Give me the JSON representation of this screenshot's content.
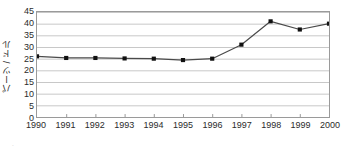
{
  "chart_data": {
    "type": "line",
    "title": "",
    "subtitle": "",
    "xlabel": "",
    "ylabel": "パーツ / ドル",
    "categories": [
      "1990",
      "1991",
      "1992",
      "1993",
      "1994",
      "1995",
      "1996",
      "1997",
      "1998",
      "1999",
      "2000"
    ],
    "values": [
      26.0,
      25.3,
      25.3,
      25.1,
      25.0,
      24.4,
      25.0,
      31.0,
      41.0,
      37.5,
      40.0
    ],
    "series": [
      {
        "name": "",
        "values": [
          26.0,
          25.3,
          25.3,
          25.1,
          25.0,
          24.4,
          25.0,
          31.0,
          41.0,
          37.5,
          40.0
        ]
      }
    ],
    "ylim": [
      0,
      45
    ],
    "yticks": [
      0,
      5,
      10,
      15,
      20,
      25,
      30,
      35,
      40,
      45
    ],
    "ytick_labels": [
      "0",
      "5",
      "10",
      "15",
      "20",
      "25",
      "30",
      "35",
      "40",
      "45"
    ],
    "xtick_labels": [
      "1990",
      "1991",
      "1992",
      "1993",
      "1994",
      "1995",
      "1996",
      "1997",
      "1998",
      "1999",
      "2000"
    ],
    "grid": "horizontal",
    "legend": "none",
    "marker": "square",
    "line_color": "#4a4a4a",
    "marker_color": "#111111",
    "grid_color": "#c8c8c8",
    "axis_color": "#9a9a9a",
    "annotations": []
  },
  "footer": {
    "artifact_text": "– · –"
  }
}
